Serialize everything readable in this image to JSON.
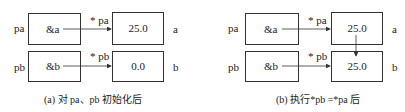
{
  "panels": [
    {
      "pa_label": "pa",
      "pb_label": "pb",
      "pa_content": "&a",
      "pb_content": "&b",
      "star_pa": "* pa",
      "star_pb": "* pb",
      "a_value": "25.0",
      "b_value": "0.0",
      "a_label": "a",
      "b_label": "b",
      "caption": "(a) 对 pa、pb 初始化后"
    },
    {
      "pa_label": "pa",
      "pb_label": "pb",
      "pa_content": "&a",
      "pb_content": "&b",
      "star_pa": "* pa",
      "star_pb": "* pb",
      "a_value": "25.0",
      "b_value": "25.0",
      "a_label": "a",
      "b_label": "b",
      "caption": "(b) 执行*pb =*pa 后"
    }
  ]
}
